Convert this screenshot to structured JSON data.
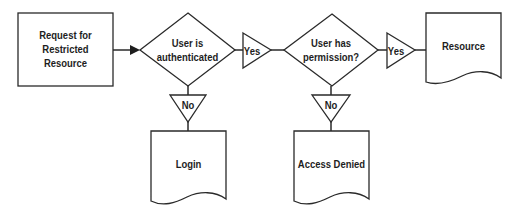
{
  "diagram": {
    "type": "flowchart",
    "colors": {
      "stroke": "#2a2a2a",
      "fill": "#ffffff",
      "text": "#1e1e1e"
    },
    "nodes": {
      "start": {
        "shape": "rectangle",
        "lines": [
          "Request for",
          "Restricted",
          "Resource"
        ]
      },
      "decision_auth": {
        "shape": "diamond",
        "lines": [
          "User is",
          "authenticated"
        ]
      },
      "decision_perm": {
        "shape": "diamond",
        "lines": [
          "User has",
          "permission?"
        ]
      },
      "resource": {
        "shape": "document",
        "label": "Resource"
      },
      "login": {
        "shape": "document",
        "label": "Login"
      },
      "access_denied": {
        "shape": "document",
        "label": "Access Denied"
      }
    },
    "branch_labels": {
      "auth_yes": "Yes",
      "auth_no": "No",
      "perm_yes": "Yes",
      "perm_no": "No"
    },
    "edges": [
      {
        "from": "start",
        "to": "decision_auth",
        "label": "",
        "arrow": true
      },
      {
        "from": "decision_auth",
        "to": "decision_perm",
        "label": "Yes"
      },
      {
        "from": "decision_auth",
        "to": "login",
        "label": "No"
      },
      {
        "from": "decision_perm",
        "to": "resource",
        "label": "Yes"
      },
      {
        "from": "decision_perm",
        "to": "access_denied",
        "label": "No"
      }
    ]
  }
}
